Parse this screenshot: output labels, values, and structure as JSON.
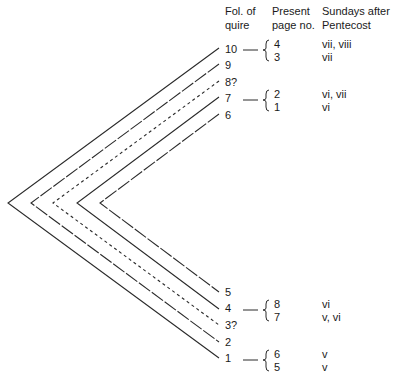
{
  "headers": {
    "folio": [
      "Fol. of",
      "quire"
    ],
    "page": [
      "Present",
      "page no."
    ],
    "sundays": [
      "Sundays after",
      "Pentecost"
    ]
  },
  "folios": [
    {
      "label": "10",
      "y": 50,
      "style": "solid"
    },
    {
      "label": "9",
      "y": 66,
      "style": "longdash"
    },
    {
      "label": "8?",
      "y": 83,
      "style": "shortdash"
    },
    {
      "label": "7",
      "y": 99,
      "style": "solid"
    },
    {
      "label": "6",
      "y": 116,
      "style": "longdash"
    },
    {
      "label": "5",
      "y": 293,
      "style": "longdash"
    },
    {
      "label": "4",
      "y": 309,
      "style": "solid"
    },
    {
      "label": "3?",
      "y": 326,
      "style": "shortdash"
    },
    {
      "label": "2",
      "y": 343,
      "style": "longdash"
    },
    {
      "label": "1",
      "y": 359,
      "style": "solid"
    }
  ],
  "bifolia": [
    {
      "top": "10",
      "bottom": "1",
      "vertex_x": 8,
      "style": "solid"
    },
    {
      "top": "9",
      "bottom": "2",
      "vertex_x": 31,
      "style": "longdash"
    },
    {
      "top": "8?",
      "bottom": "3?",
      "vertex_x": 53,
      "style": "shortdash"
    },
    {
      "top": "7",
      "bottom": "4",
      "vertex_x": 77,
      "style": "solid"
    },
    {
      "top": "6",
      "bottom": "5",
      "vertex_x": 100,
      "style": "longdash"
    }
  ],
  "groups": [
    {
      "folio": "10",
      "pages": [
        "4",
        "3"
      ],
      "sundays": [
        "vii, viii",
        "vii"
      ]
    },
    {
      "folio": "7",
      "pages": [
        "2",
        "1"
      ],
      "sundays": [
        "vi, vii",
        "vi"
      ]
    },
    {
      "folio": "4",
      "pages": [
        "8",
        "7"
      ],
      "sundays": [
        "vi",
        "v, vi"
      ]
    },
    {
      "folio": "1",
      "pages": [
        "6",
        "5"
      ],
      "sundays": [
        "v",
        "v"
      ]
    }
  ],
  "colors": {
    "line": "#2a2a2a",
    "text": "#1a1a1a",
    "background": "#ffffff"
  }
}
